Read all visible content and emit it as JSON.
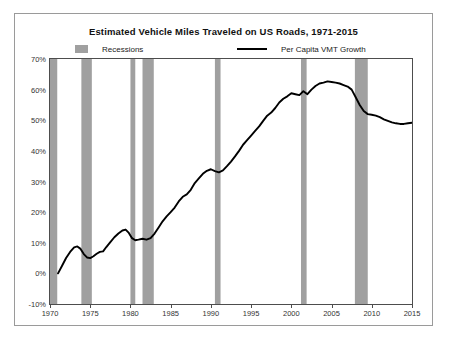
{
  "chart_data": {
    "type": "line",
    "title": "Estimated Vehicle Miles Traveled on US Roads, 1971-2015",
    "xlabel": "",
    "ylabel": "",
    "xlim": [
      1970,
      2015
    ],
    "ylim": [
      -10,
      70
    ],
    "grid": false,
    "legend_position": "top",
    "yticks": [
      "-10%",
      "0%",
      "10%",
      "20%",
      "30%",
      "40%",
      "50%",
      "60%",
      "70%"
    ],
    "ytick_values": [
      -10,
      0,
      10,
      20,
      30,
      40,
      50,
      60,
      70
    ],
    "xticks": [
      "1970",
      "1975",
      "1980",
      "1985",
      "1990",
      "1995",
      "2000",
      "2005",
      "2010",
      "2015"
    ],
    "xtick_values": [
      1970,
      1975,
      1980,
      1985,
      1990,
      1995,
      2000,
      2005,
      2010,
      2015
    ],
    "series": [
      {
        "name": "Per Capita VMT Growth",
        "color": "#000000",
        "x": [
          1971.0,
          1971.5,
          1972.0,
          1972.5,
          1973.0,
          1973.4,
          1973.8,
          1974.2,
          1974.6,
          1975.0,
          1975.4,
          1975.8,
          1976.2,
          1976.6,
          1977.0,
          1977.5,
          1978.0,
          1978.5,
          1979.0,
          1979.4,
          1979.8,
          1980.2,
          1980.6,
          1981.0,
          1981.5,
          1982.0,
          1982.5,
          1983.0,
          1983.5,
          1984.0,
          1984.5,
          1985.0,
          1985.5,
          1986.0,
          1986.5,
          1987.0,
          1987.5,
          1988.0,
          1988.5,
          1989.0,
          1989.5,
          1990.0,
          1990.5,
          1991.0,
          1991.5,
          1992.0,
          1992.5,
          1993.0,
          1993.5,
          1994.0,
          1994.5,
          1995.0,
          1995.5,
          1996.0,
          1996.5,
          1997.0,
          1997.5,
          1998.0,
          1998.5,
          1999.0,
          1999.5,
          2000.0,
          2000.5,
          2001.0,
          2001.5,
          2002.0,
          2002.5,
          2003.0,
          2003.5,
          2004.0,
          2004.5,
          2005.0,
          2005.5,
          2006.0,
          2006.5,
          2007.0,
          2007.5,
          2008.0,
          2008.5,
          2009.0,
          2009.5,
          2010.0,
          2010.5,
          2011.0,
          2011.5,
          2012.0,
          2012.5,
          2013.0,
          2013.5,
          2014.0,
          2014.5,
          2015.0
        ],
        "y": [
          0.0,
          2.5,
          5.0,
          7.0,
          8.5,
          8.8,
          8.0,
          6.3,
          5.2,
          5.0,
          5.6,
          6.4,
          7.0,
          7.2,
          8.6,
          10.2,
          11.8,
          13.0,
          14.0,
          14.3,
          13.2,
          11.5,
          10.8,
          11.0,
          11.3,
          11.0,
          11.5,
          13.0,
          15.0,
          17.0,
          18.6,
          20.0,
          21.5,
          23.5,
          25.0,
          25.8,
          27.3,
          29.5,
          31.0,
          32.5,
          33.5,
          34.0,
          33.4,
          33.0,
          33.6,
          35.0,
          36.5,
          38.2,
          40.0,
          42.0,
          43.5,
          45.0,
          46.5,
          48.0,
          49.8,
          51.5,
          52.5,
          54.0,
          55.8,
          57.0,
          57.8,
          58.8,
          58.5,
          58.2,
          59.5,
          58.5,
          60.0,
          61.2,
          62.0,
          62.3,
          62.7,
          62.5,
          62.3,
          62.0,
          61.5,
          61.0,
          60.0,
          57.5,
          55.0,
          53.0,
          52.0,
          51.8,
          51.5,
          51.0,
          50.3,
          49.8,
          49.3,
          49.0,
          48.8,
          48.8,
          49.0,
          49.2
        ]
      }
    ],
    "recession_bands": [
      {
        "start": 1969.9,
        "end": 1970.9
      },
      {
        "start": 1973.9,
        "end": 1975.2
      },
      {
        "start": 1980.0,
        "end": 1980.6
      },
      {
        "start": 1981.5,
        "end": 1982.9
      },
      {
        "start": 1990.5,
        "end": 1991.2
      },
      {
        "start": 2001.2,
        "end": 2001.9
      },
      {
        "start": 2007.9,
        "end": 2009.5
      }
    ],
    "recession_color": "#a0a0a0",
    "annotations": []
  },
  "legend": {
    "recessions_label": "Recessions",
    "vmt_label": "Per Capita VMT Growth"
  }
}
